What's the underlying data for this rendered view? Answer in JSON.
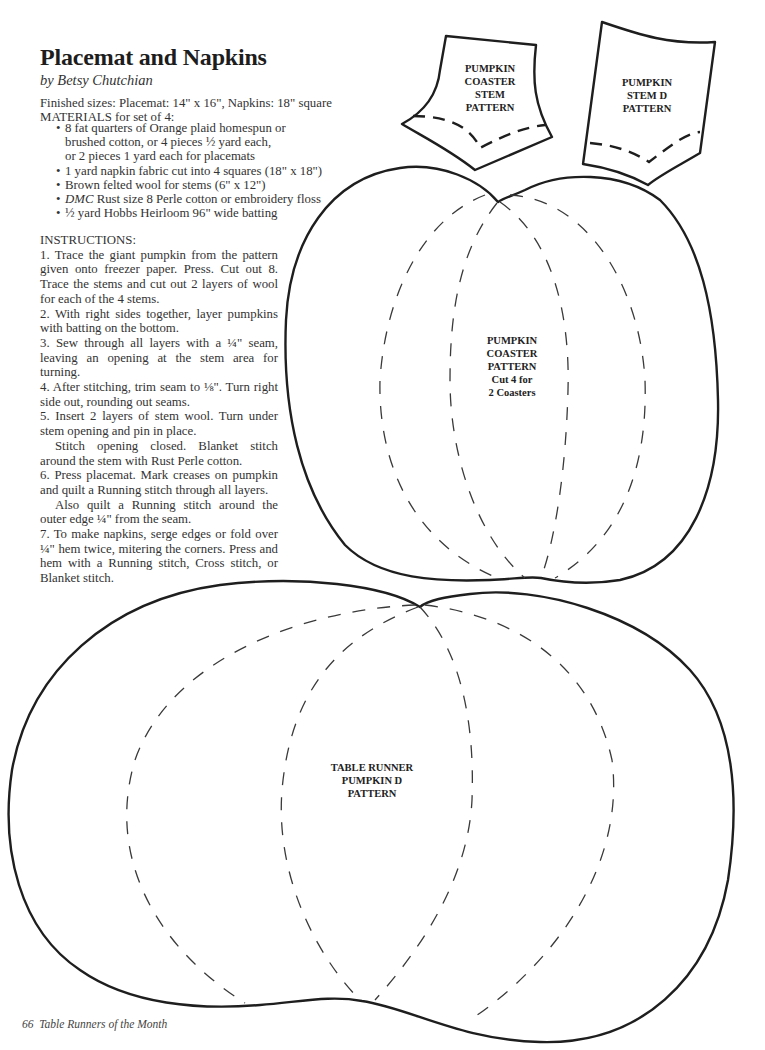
{
  "article": {
    "title": "Placemat and Napkins",
    "byline": "by Betsy Chutchian",
    "finished_sizes": "Finished sizes: Placemat: 14\" x 16\", Napkins: 18\" square",
    "materials_heading": "MATERIALS for set of 4:",
    "materials": [
      {
        "bullet": "•",
        "lines": [
          "8 fat quarters of Orange plaid homespun or",
          "brushed cotton, or 4 pieces ½ yard each,",
          "or 2 pieces 1 yard each for placemats"
        ]
      },
      {
        "bullet": "•",
        "lines": [
          "1 yard napkin fabric cut into 4 squares (18\" x 18\")"
        ]
      },
      {
        "bullet": "•",
        "lines": [
          "Brown felted wool for stems (6\" x 12\")"
        ]
      },
      {
        "bullet": "•",
        "brand": "DMC",
        "lines": [
          " Rust size 8 Perle cotton or embroidery floss"
        ]
      },
      {
        "bullet": "•",
        "lines": [
          "½ yard Hobbs Heirloom 96\" wide batting"
        ]
      }
    ],
    "instructions_heading": "INSTRUCTIONS:",
    "instructions": [
      {
        "text": "1. Trace the giant pumpkin from the pattern given onto freezer paper. Press. Cut out 8. Trace the stems and cut out 2 layers of wool for each of the 4 stems.",
        "indent": false
      },
      {
        "text": "2. With right sides together, layer pumpkins with batting on the bottom.",
        "indent": false
      },
      {
        "text": "3. Sew through all layers with a ¼\" seam, leaving an opening at the stem area for turning.",
        "indent": false
      },
      {
        "text": "4. After stitching, trim seam to ⅛\". Turn right side out, rounding out seams.",
        "indent": false
      },
      {
        "text": "5. Insert 2 layers of stem wool. Turn under stem opening and pin in place.",
        "indent": false
      },
      {
        "text": "Stitch opening closed. Blanket stitch around the stem with Rust Perle cotton.",
        "indent": true
      },
      {
        "text": "6. Press placemat. Mark creases on pumpkin and quilt a Running stitch through all layers.",
        "indent": false
      },
      {
        "text": "Also quilt a Running stitch around the outer edge ¼\" from the seam.",
        "indent": true
      },
      {
        "text": "7. To make napkins, serge edges or fold over ¼\" hem twice, mitering the corners. Press and hem with a Running stitch, Cross stitch, or Blanket stitch.",
        "indent": false
      }
    ]
  },
  "patterns": {
    "coaster_stem": {
      "lines": [
        "PUMPKIN",
        "COASTER",
        "STEM",
        "PATTERN"
      ]
    },
    "stem_d": {
      "lines": [
        "PUMPKIN",
        "STEM D",
        "PATTERN"
      ]
    },
    "coaster_pumpkin": {
      "lines": [
        "PUMPKIN",
        "COASTER",
        "PATTERN",
        "Cut 4 for",
        "2 Coasters"
      ]
    },
    "table_runner_pumpkin": {
      "lines": [
        "TABLE RUNNER",
        "PUMPKIN D",
        "PATTERN"
      ]
    }
  },
  "footer": {
    "page_number": "66",
    "book_title": "Table Runners of the Month"
  }
}
